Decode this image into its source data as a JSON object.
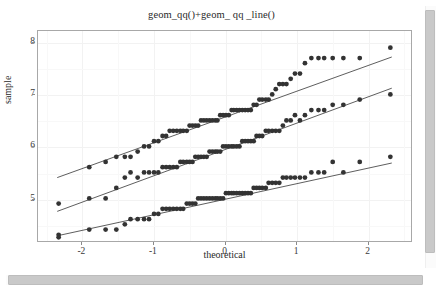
{
  "window": {
    "background_color": "#ffffff",
    "scrollbars": {
      "vertical_name": "vertical-scrollbar",
      "horizontal_name": "horizontal-scrollbar",
      "thumb_color": "#c9c9c9"
    }
  },
  "chart_data": {
    "type": "scatter",
    "title": "geom_qq()+geom_ qq _line()",
    "xlabel": "theoretical",
    "ylabel": "sample",
    "xlim": [
      -2.62,
      2.62
    ],
    "ylim": [
      4.18,
      8.22
    ],
    "xticks": [
      -2,
      -1,
      0,
      1,
      2
    ],
    "xticklabels": [
      "-2",
      "-1",
      "0",
      "1",
      "2"
    ],
    "yticks": [
      5,
      6,
      7,
      8
    ],
    "yticklabels": [
      "5",
      "6",
      "7",
      "8"
    ],
    "grid": true,
    "grid_color": "#f2f2f2",
    "legend": "none",
    "point_color": "#333333",
    "point_size": 2.4,
    "line_color": "#4a4a4a",
    "line_width": 0.9,
    "panel_border_color": "#a8a8a8",
    "series": [
      {
        "name": "upper",
        "qq_line": {
          "x1": -2.35,
          "y1": 5.4,
          "x2": 2.35,
          "y2": 7.72
        },
        "x": [
          -2.33,
          -1.9,
          -1.67,
          -1.52,
          -1.4,
          -1.32,
          -1.22,
          -1.13,
          -1.06,
          -0.99,
          -0.93,
          -0.87,
          -0.82,
          -0.77,
          -0.72,
          -0.67,
          -0.62,
          -0.58,
          -0.53,
          -0.49,
          -0.45,
          -0.41,
          -0.37,
          -0.33,
          -0.29,
          -0.25,
          -0.21,
          -0.17,
          -0.13,
          -0.1,
          -0.06,
          -0.02,
          0.02,
          0.06,
          0.1,
          0.13,
          0.17,
          0.21,
          0.25,
          0.29,
          0.33,
          0.37,
          0.41,
          0.45,
          0.49,
          0.53,
          0.58,
          0.62,
          0.67,
          0.72,
          0.77,
          0.82,
          0.87,
          0.93,
          0.99,
          1.06,
          1.13,
          1.22,
          1.32,
          1.4,
          1.52,
          1.67,
          1.9,
          2.33
        ],
        "y": [
          4.9,
          5.6,
          5.7,
          5.8,
          5.8,
          5.8,
          5.9,
          6.0,
          6.0,
          6.1,
          6.1,
          6.2,
          6.2,
          6.3,
          6.3,
          6.3,
          6.3,
          6.3,
          6.3,
          6.4,
          6.4,
          6.4,
          6.4,
          6.5,
          6.5,
          6.5,
          6.5,
          6.5,
          6.5,
          6.5,
          6.6,
          6.6,
          6.6,
          6.6,
          6.7,
          6.7,
          6.7,
          6.7,
          6.7,
          6.7,
          6.7,
          6.7,
          6.8,
          6.8,
          6.9,
          6.9,
          6.9,
          6.9,
          7.0,
          7.1,
          7.2,
          7.2,
          7.2,
          7.3,
          7.4,
          7.4,
          7.6,
          7.7,
          7.7,
          7.7,
          7.7,
          7.7,
          7.7,
          7.9
        ]
      },
      {
        "name": "middle",
        "qq_line": {
          "x1": -2.35,
          "y1": 4.75,
          "x2": 2.35,
          "y2": 7.12
        },
        "x": [
          -2.33,
          -1.9,
          -1.67,
          -1.52,
          -1.4,
          -1.32,
          -1.22,
          -1.13,
          -1.06,
          -0.99,
          -0.93,
          -0.87,
          -0.82,
          -0.77,
          -0.72,
          -0.67,
          -0.62,
          -0.58,
          -0.53,
          -0.49,
          -0.45,
          -0.41,
          -0.37,
          -0.33,
          -0.29,
          -0.25,
          -0.21,
          -0.17,
          -0.13,
          -0.1,
          -0.06,
          -0.02,
          0.02,
          0.06,
          0.1,
          0.13,
          0.17,
          0.21,
          0.25,
          0.29,
          0.33,
          0.37,
          0.41,
          0.45,
          0.49,
          0.53,
          0.58,
          0.62,
          0.67,
          0.72,
          0.77,
          0.82,
          0.87,
          0.93,
          0.99,
          1.06,
          1.13,
          1.22,
          1.32,
          1.4,
          1.52,
          1.67,
          1.9,
          2.33
        ],
        "y": [
          4.3,
          5.0,
          5.0,
          5.2,
          5.4,
          5.5,
          5.4,
          5.5,
          5.5,
          5.5,
          5.5,
          5.6,
          5.6,
          5.6,
          5.6,
          5.6,
          5.7,
          5.7,
          5.7,
          5.7,
          5.7,
          5.8,
          5.8,
          5.8,
          5.8,
          5.8,
          5.9,
          5.9,
          5.9,
          5.9,
          5.9,
          6.0,
          6.0,
          6.0,
          6.0,
          6.0,
          6.0,
          6.0,
          6.1,
          6.1,
          6.1,
          6.1,
          6.1,
          6.2,
          6.2,
          6.2,
          6.3,
          6.3,
          6.3,
          6.3,
          6.3,
          6.4,
          6.5,
          6.5,
          6.6,
          6.5,
          6.6,
          6.7,
          6.7,
          6.7,
          6.8,
          6.8,
          6.9,
          7.0
        ]
      },
      {
        "name": "lower",
        "qq_line": {
          "x1": -2.35,
          "y1": 4.28,
          "x2": 2.35,
          "y2": 5.68
        },
        "x": [
          -2.33,
          -1.9,
          -1.67,
          -1.52,
          -1.4,
          -1.32,
          -1.22,
          -1.13,
          -1.06,
          -0.99,
          -0.93,
          -0.87,
          -0.82,
          -0.77,
          -0.72,
          -0.67,
          -0.62,
          -0.58,
          -0.53,
          -0.49,
          -0.45,
          -0.41,
          -0.37,
          -0.33,
          -0.29,
          -0.25,
          -0.21,
          -0.17,
          -0.13,
          -0.1,
          -0.06,
          -0.02,
          0.02,
          0.06,
          0.1,
          0.13,
          0.17,
          0.21,
          0.25,
          0.29,
          0.33,
          0.37,
          0.41,
          0.45,
          0.49,
          0.53,
          0.58,
          0.62,
          0.67,
          0.72,
          0.77,
          0.82,
          0.87,
          0.93,
          0.99,
          1.06,
          1.13,
          1.22,
          1.32,
          1.4,
          1.52,
          1.67,
          1.9,
          2.33
        ],
        "y": [
          4.25,
          4.4,
          4.4,
          4.4,
          4.5,
          4.6,
          4.6,
          4.6,
          4.6,
          4.7,
          4.7,
          4.8,
          4.8,
          4.8,
          4.8,
          4.8,
          4.8,
          4.8,
          4.9,
          4.9,
          4.9,
          4.9,
          5.0,
          5.0,
          5.0,
          5.0,
          5.0,
          5.0,
          5.0,
          5.0,
          5.0,
          5.0,
          5.1,
          5.1,
          5.1,
          5.1,
          5.1,
          5.1,
          5.1,
          5.1,
          5.1,
          5.1,
          5.2,
          5.2,
          5.2,
          5.2,
          5.2,
          5.3,
          5.3,
          5.3,
          5.3,
          5.4,
          5.4,
          5.4,
          5.4,
          5.4,
          5.4,
          5.5,
          5.5,
          5.5,
          5.7,
          5.5,
          5.7,
          5.8
        ]
      }
    ]
  }
}
